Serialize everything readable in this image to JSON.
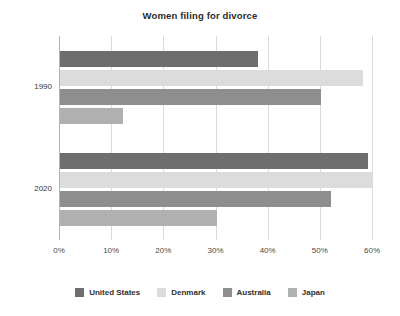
{
  "chart_data": {
    "type": "bar",
    "orientation": "horizontal",
    "title": "Women filing for divorce",
    "xlabel": "",
    "ylabel": "",
    "categories": [
      "1990",
      "2020"
    ],
    "xlim": [
      0,
      60
    ],
    "xticks": [
      0,
      10,
      20,
      30,
      40,
      50,
      60
    ],
    "xtick_labels": [
      "0%",
      "10%",
      "20%",
      "30%",
      "40%",
      "50%",
      "60%"
    ],
    "grid": true,
    "legend_position": "bottom",
    "series": [
      {
        "name": "United States",
        "color": "#6e6e6e",
        "values": [
          38,
          59
        ]
      },
      {
        "name": "Denmark",
        "color": "#dcdcdc",
        "values": [
          58,
          60
        ]
      },
      {
        "name": "Australia",
        "color": "#8e8e8e",
        "values": [
          50,
          52
        ]
      },
      {
        "name": "Japan",
        "color": "#b0b0b0",
        "values": [
          12,
          30
        ]
      }
    ]
  },
  "axis": {
    "grid_color": "#dadada",
    "axis_line_color": "#b4b4b4"
  }
}
